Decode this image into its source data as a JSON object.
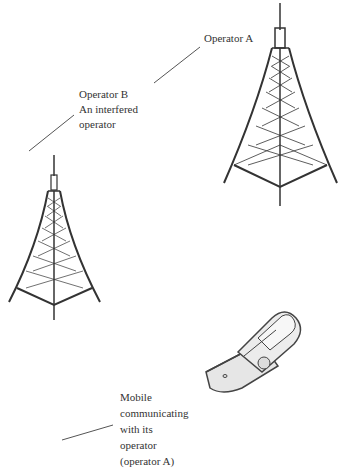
{
  "labels": {
    "operator_a": [
      "Operator A"
    ],
    "operator_b": [
      "Operator B",
      "An interfered",
      "operator"
    ],
    "mobile": [
      "Mobile",
      "communicating",
      "with its",
      "operator",
      "(operator A)"
    ]
  },
  "elements": {
    "tower_a": "Operator A tower",
    "tower_b": "Operator B tower",
    "phone": "mobile phone"
  },
  "colors": {
    "line": "#333333",
    "text": "#333333",
    "phone_fill": "#eeeeee"
  }
}
